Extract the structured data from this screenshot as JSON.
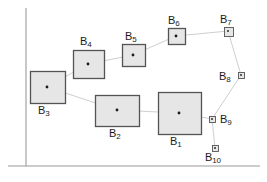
{
  "figure": {
    "width": 267,
    "height": 182,
    "background": "#ffffff"
  },
  "style": {
    "axis_color": "#9a9a9a",
    "box_stroke": "#545454",
    "box_fill": "#e6e6e6",
    "link_color": "#c8c8c8",
    "center_dot_color": "#1a1a1a",
    "label_color": "#1a1a1a"
  },
  "axes": {
    "y_axis": {
      "x": 26,
      "y_top": 8,
      "y_bottom": 166
    },
    "x_axis": {
      "y": 166,
      "x_left": 8,
      "x_right": 260
    }
  },
  "chart_data": {
    "type": "scatter",
    "title": "",
    "xlabel": "",
    "ylabel": "",
    "grid": false,
    "legend": null,
    "note": "Each item is a rectangle (bounding box) with a marked centre point; boxes are linked in order B3-B4-B5-B6-B7-B8-B9-B10 and B3-B2-B1-B9",
    "items": [
      {
        "id": "B1",
        "label": "B",
        "subscript": "1",
        "cx": 179,
        "cy": 113,
        "box_x": 158,
        "box_y": 92,
        "box_w": 43,
        "box_h": 42,
        "label_x": 170,
        "label_y": 136,
        "label_pos": "below"
      },
      {
        "id": "B2",
        "label": "B",
        "subscript": "2",
        "cx": 117,
        "cy": 110,
        "box_x": 95,
        "box_y": 95,
        "box_w": 44,
        "box_h": 31,
        "label_x": 109,
        "label_y": 128,
        "label_pos": "below"
      },
      {
        "id": "B3",
        "label": "B",
        "subscript": "3",
        "cx": 47,
        "cy": 87,
        "box_x": 30,
        "box_y": 71,
        "box_w": 35,
        "box_h": 32,
        "label_x": 38,
        "label_y": 105,
        "label_pos": "below"
      },
      {
        "id": "B4",
        "label": "B",
        "subscript": "4",
        "cx": 88,
        "cy": 64,
        "box_x": 73,
        "box_y": 50,
        "box_w": 31,
        "box_h": 28,
        "label_x": 80,
        "label_y": 36,
        "label_pos": "above"
      },
      {
        "id": "B5",
        "label": "B",
        "subscript": "5",
        "cx": 133,
        "cy": 55,
        "box_x": 122,
        "box_y": 44,
        "box_w": 23,
        "box_h": 22,
        "label_x": 125,
        "label_y": 31,
        "label_pos": "above"
      },
      {
        "id": "B6",
        "label": "B",
        "subscript": "6",
        "cx": 176,
        "cy": 36,
        "box_x": 168,
        "box_y": 28,
        "box_w": 17,
        "box_h": 16,
        "label_x": 168,
        "label_y": 15,
        "label_pos": "above"
      },
      {
        "id": "B7",
        "label": "B",
        "subscript": "7",
        "cx": 228,
        "cy": 31,
        "box_x": 224,
        "box_y": 27,
        "box_w": 9,
        "box_h": 9,
        "label_x": 220,
        "label_y": 14,
        "label_pos": "above"
      },
      {
        "id": "B8",
        "label": "B",
        "subscript": "8",
        "cx": 241,
        "cy": 75,
        "box_x": 238,
        "box_y": 72,
        "box_w": 6,
        "box_h": 6,
        "label_x": 219,
        "label_y": 71,
        "label_pos": "left"
      },
      {
        "id": "B9",
        "label": "B",
        "subscript": "9",
        "cx": 212,
        "cy": 119,
        "box_x": 209,
        "box_y": 116,
        "box_w": 6,
        "box_h": 6,
        "label_x": 220,
        "label_y": 114,
        "label_pos": "right"
      },
      {
        "id": "B10",
        "label": "B",
        "subscript": "10",
        "cx": 215,
        "cy": 148,
        "box_x": 212,
        "box_y": 145,
        "box_w": 6,
        "box_h": 6,
        "label_x": 205,
        "label_y": 152,
        "label_pos": "below"
      }
    ],
    "links": [
      [
        "B3",
        "B4"
      ],
      [
        "B4",
        "B5"
      ],
      [
        "B5",
        "B6"
      ],
      [
        "B6",
        "B7"
      ],
      [
        "B7",
        "B8"
      ],
      [
        "B8",
        "B9"
      ],
      [
        "B9",
        "B10"
      ],
      [
        "B3",
        "B2"
      ],
      [
        "B2",
        "B1"
      ],
      [
        "B1",
        "B9"
      ]
    ]
  }
}
